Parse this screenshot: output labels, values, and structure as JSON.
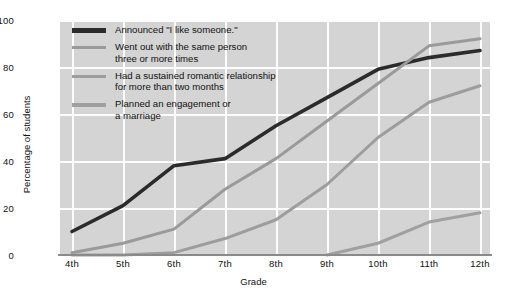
{
  "chart_data": {
    "type": "line",
    "title": "",
    "xlabel": "Grade",
    "ylabel": "Percentage of students",
    "categories": [
      "4th",
      "5th",
      "6th",
      "7th",
      "8th",
      "9th",
      "10th",
      "11th",
      "12th"
    ],
    "ylim": [
      0,
      100
    ],
    "yticks": [
      "0",
      "20",
      "40",
      "60",
      "80",
      "100"
    ],
    "grid": true,
    "legend_position": "inside-top-left",
    "series": [
      {
        "name": "Announced \"I like someone.\"",
        "color": "#2b2b2b",
        "values": [
          10,
          21,
          38,
          41,
          55,
          67,
          79,
          84,
          87
        ]
      },
      {
        "name": "Went out with the same person\nthree or more times",
        "color": "#9a9a9a",
        "values": [
          1,
          5,
          11,
          28,
          41,
          57,
          73,
          89,
          92
        ]
      },
      {
        "name": "Had a sustained romantic relationship\nfor more than two months",
        "color": "#9d9d9d",
        "values": [
          0,
          0,
          1,
          7,
          15,
          30,
          50,
          65,
          72
        ]
      },
      {
        "name": "Planned an engagement or\na marriage",
        "color": "#a0a0a0",
        "values": [
          null,
          null,
          null,
          null,
          null,
          0,
          5,
          14,
          18
        ]
      }
    ]
  },
  "axes": {
    "ylabel": "Percentage of students",
    "xlabel": "Grade",
    "yticks": [
      "100",
      "80",
      "60",
      "40",
      "20",
      "0"
    ],
    "xticks": [
      "4th",
      "5th",
      "6th",
      "7th",
      "8th",
      "9th",
      "10th",
      "11th",
      "12th"
    ]
  },
  "legend": {
    "items": [
      {
        "label": "Announced \"I like someone.\"",
        "color": "#2b2b2b"
      },
      {
        "label": "Went out with the same person\nthree or more times",
        "color": "#9a9a9a"
      },
      {
        "label": "Had a sustained romantic relationship\nfor more than two months",
        "color": "#9d9d9d"
      },
      {
        "label": "Planned an engagement or\na marriage",
        "color": "#a0a0a0"
      }
    ]
  },
  "style": {
    "plot_background": "#d4d4d4",
    "page_background": "#ffffff",
    "gridline_color": "#fdfdfd",
    "axis_color": "#8a8a8a"
  }
}
